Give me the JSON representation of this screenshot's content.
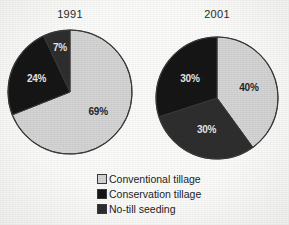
{
  "figure": {
    "background_color": "#fbfbfa",
    "outline_color": "#3a3a3a"
  },
  "titles": {
    "left": "1991",
    "right": "2001"
  },
  "legend": {
    "items": [
      {
        "label": "Conventional tillage",
        "color": "#d4d4d4",
        "swatch_name": "legend-swatch-conventional"
      },
      {
        "label": "Conservation tillage",
        "color": "#161616",
        "swatch_name": "legend-swatch-conservation"
      },
      {
        "label": "No-till seeding",
        "color": "#2e2e2e",
        "swatch_name": "legend-swatch-no-till"
      }
    ]
  },
  "chart_data": [
    {
      "type": "pie",
      "title": "1991",
      "categories": [
        "Conventional tillage",
        "Conservation tillage",
        "No-till seeding"
      ],
      "values": [
        69,
        24,
        7
      ],
      "labels": [
        "69%",
        "24%",
        "7%"
      ],
      "colors": [
        "#d4d4d4",
        "#161616",
        "#2e2e2e"
      ],
      "label_text_colors": [
        "#262626",
        "#e6e6e6",
        "#e6e6e6"
      ],
      "unit": "%",
      "start_angle_deg": 0,
      "direction": "clockwise",
      "center": {
        "x": 70,
        "y": 92
      },
      "radius": 62,
      "legend_position": "below",
      "grid": false
    },
    {
      "type": "pie",
      "title": "2001",
      "categories": [
        "Conventional tillage",
        "No-till seeding",
        "Conservation tillage"
      ],
      "values": [
        40,
        30,
        30
      ],
      "labels": [
        "40%",
        "30%",
        "30%"
      ],
      "colors": [
        "#d4d4d4",
        "#2e2e2e",
        "#161616"
      ],
      "label_text_colors": [
        "#262626",
        "#e6e6e6",
        "#e6e6e6"
      ],
      "unit": "%",
      "start_angle_deg": 0,
      "direction": "clockwise",
      "center": {
        "x": 217,
        "y": 98
      },
      "radius": 61,
      "legend_position": "below",
      "grid": false
    }
  ]
}
